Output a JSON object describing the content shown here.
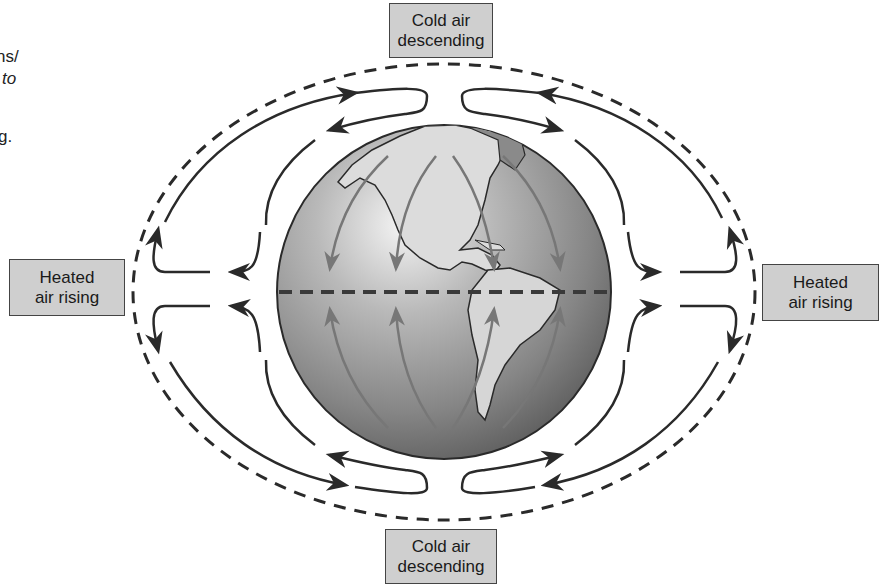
{
  "diagram": {
    "labels": {
      "top": {
        "line1": "Cold air",
        "line2": "descending"
      },
      "bottom": {
        "line1": "Cold air",
        "line2": "descending"
      },
      "left": {
        "line1": "Heated",
        "line2": "air rising"
      },
      "right": {
        "line1": "Heated",
        "line2": "air rising"
      }
    },
    "elements": {
      "globe": "Earth (Americas view)",
      "equator": "dashed equator line",
      "surface_winds_north": "arrows pointing toward equator",
      "surface_winds_south": "arrows pointing toward equator",
      "outer_boundary": "dashed ellipse (atmosphere)"
    },
    "colors": {
      "label_fill": "#cfcfcf",
      "globe_dark": "#6e6e6e",
      "globe_light": "#eeeeee",
      "arrow_stroke": "#2a2a2a",
      "surface_arrow": "#7a7a7a"
    }
  },
  "page_fragment": {
    "line1": "ns/",
    "line2": "to",
    "line3": "g."
  }
}
